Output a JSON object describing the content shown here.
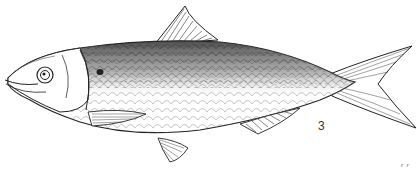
{
  "figure": {
    "figure_number": "3",
    "corner_mark": "r r",
    "colors": {
      "ink": "#1a1a1a",
      "paper": "#ffffff",
      "shade": "#555555"
    }
  }
}
